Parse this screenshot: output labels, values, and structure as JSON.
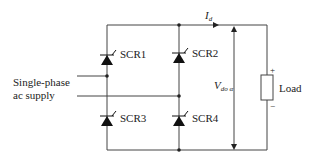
{
  "diagram": {
    "supply_label_line1": "Single-phase",
    "supply_label_line2": "ac supply",
    "thyristors": [
      {
        "label": "SCR1"
      },
      {
        "label": "SCR2"
      },
      {
        "label": "SCR3"
      },
      {
        "label": "SCR4"
      }
    ],
    "current_label": {
      "main": "I",
      "sub": "d"
    },
    "voltage_label": {
      "main": "V",
      "sub": "do α"
    },
    "load_label": "Load",
    "load_plus": "+",
    "load_minus": "−",
    "colors": {
      "line": "#333333",
      "text": "#222222",
      "background": "#ffffff"
    }
  }
}
